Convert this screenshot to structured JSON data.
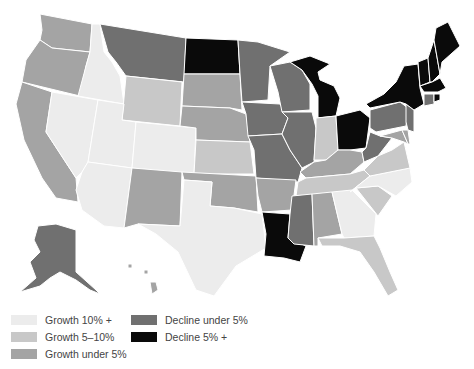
{
  "map": {
    "type": "choropleth",
    "region": "United States",
    "categories": {
      "g10": {
        "label": "Growth 10% +",
        "color": "#ececec"
      },
      "g5_10": {
        "label": "Growth 5–10%",
        "color": "#c8c8c8"
      },
      "g_under5": {
        "label": "Growth under 5%",
        "color": "#a4a4a4"
      },
      "d_under5": {
        "label": "Decline under 5%",
        "color": "#707070"
      },
      "d5": {
        "label": "Decline 5% +",
        "color": "#0a0a0a"
      }
    },
    "states": {
      "WA": "g_under5",
      "OR": "g_under5",
      "CA": "g_under5",
      "ID": "g10",
      "NV": "g10",
      "MT": "d_under5",
      "WY": "g5_10",
      "UT": "g10",
      "AZ": "g10",
      "CO": "g10",
      "NM": "g_under5",
      "ND": "d5",
      "SD": "g_under5",
      "NE": "g_under5",
      "KS": "g5_10",
      "OK": "g_under5",
      "TX": "g10",
      "MN": "d_under5",
      "IA": "d_under5",
      "MO": "d_under5",
      "AR": "g_under5",
      "LA": "d5",
      "WI": "d_under5",
      "IL": "d_under5",
      "MI": "d5",
      "IN": "g5_10",
      "OH": "d5",
      "KY": "g_under5",
      "TN": "g5_10",
      "MS": "d_under5",
      "AL": "g_under5",
      "GA": "g10",
      "FL": "g5_10",
      "SC": "g5_10",
      "NC": "g10",
      "VA": "g5_10",
      "WV": "d_under5",
      "PA": "d_under5",
      "NY": "d5",
      "VT": "d5",
      "NH": "d5",
      "ME": "d5",
      "MA": "d5",
      "CT": "d_under5",
      "RI": "d5",
      "NJ": "d_under5",
      "DE": "g_under5",
      "MD": "g_under5",
      "AK": "d_under5",
      "HI": "g_under5"
    }
  },
  "legend": {
    "items": [
      {
        "key": "g10",
        "label": "Growth 10% +",
        "color": "#ececec"
      },
      {
        "key": "g5_10",
        "label": "Growth 5–10%",
        "color": "#c8c8c8"
      },
      {
        "key": "g_under5",
        "label": "Growth under 5%",
        "color": "#a4a4a4"
      },
      {
        "key": "d_under5",
        "label": "Decline under 5%",
        "color": "#707070"
      },
      {
        "key": "d5",
        "label": "Decline 5% +",
        "color": "#0a0a0a"
      }
    ]
  }
}
